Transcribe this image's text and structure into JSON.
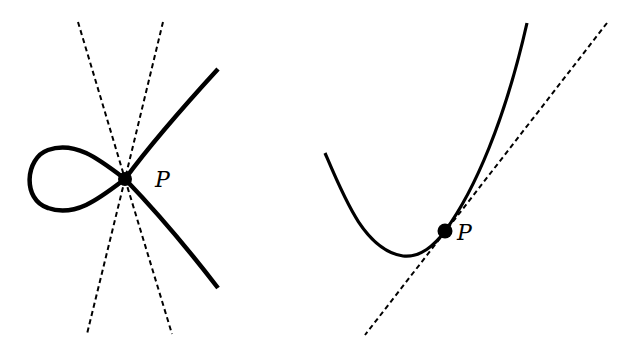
{
  "figure": {
    "panels": [
      {
        "id": "node",
        "point_label": "P",
        "tangent_lines": 2,
        "point": [
          125,
          179
        ]
      },
      {
        "id": "smooth",
        "point_label": "P",
        "tangent_lines": 1,
        "point": [
          445,
          231
        ]
      }
    ],
    "colors": {
      "stroke": "#000000",
      "background": "#ffffff"
    }
  }
}
